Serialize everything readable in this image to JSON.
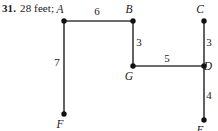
{
  "answer": {
    "problem_number": "31.",
    "value": "28 feet;"
  },
  "figure": {
    "name": "rectilinear-path-diagram",
    "stroke_color": "#3a3a3a",
    "vertex_color": "#111111",
    "text_color": "#1a1a1a",
    "vertices": [
      {
        "id": "A",
        "label": "A",
        "x": 64,
        "y": 21,
        "label_x": 60,
        "label_y": 13
      },
      {
        "id": "B",
        "label": "B",
        "x": 133,
        "y": 21,
        "label_x": 129,
        "label_y": 13
      },
      {
        "id": "C",
        "label": "C",
        "x": 204,
        "y": 21,
        "label_x": 200,
        "label_y": 13
      },
      {
        "id": "D",
        "label": "D",
        "x": 204,
        "y": 66,
        "label_x": 208,
        "label_y": 70
      },
      {
        "id": "G",
        "label": "G",
        "x": 133,
        "y": 66,
        "label_x": 129,
        "label_y": 80
      },
      {
        "id": "F",
        "label": "F",
        "x": 64,
        "y": 114,
        "label_x": 60,
        "label_y": 128
      },
      {
        "id": "E",
        "label": "E",
        "x": 204,
        "y": 120,
        "label_x": 200,
        "label_y": 134
      }
    ],
    "edges": [
      {
        "id": "AB",
        "from": "A",
        "to": "B",
        "length": "6",
        "label_x": 97,
        "label_y": 15
      },
      {
        "id": "AF",
        "from": "A",
        "to": "F",
        "length": "7",
        "label_x": 57,
        "label_y": 66
      },
      {
        "id": "BG",
        "from": "B",
        "to": "G",
        "length": "3",
        "label_x": 139,
        "label_y": 46
      },
      {
        "id": "GD",
        "from": "G",
        "to": "D",
        "length": "5",
        "label_x": 167,
        "label_y": 62
      },
      {
        "id": "CD",
        "from": "C",
        "to": "D",
        "length": "3",
        "label_x": 209,
        "label_y": 46
      },
      {
        "id": "DE",
        "from": "D",
        "to": "E",
        "length": "4",
        "label_x": 209,
        "label_y": 99
      }
    ]
  }
}
